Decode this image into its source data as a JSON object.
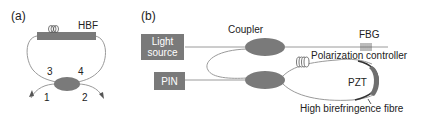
{
  "panel_a": {
    "label": "(a)",
    "hbf_label": "HBF",
    "ports": [
      "1",
      "2",
      "3",
      "4"
    ]
  },
  "panel_b": {
    "label": "(b)",
    "light_source": [
      "Light",
      "source"
    ],
    "pin_label": "PIN",
    "coupler_label": "Coupler",
    "fbg_label": "FBG",
    "polarization_label": "Polarization controller",
    "pzt_label": "PZT",
    "fibre_label": "High birefringence fibre"
  },
  "colors": {
    "component": "#7a7a7a",
    "fibre": "#9a9a9a",
    "text": "#222222"
  }
}
